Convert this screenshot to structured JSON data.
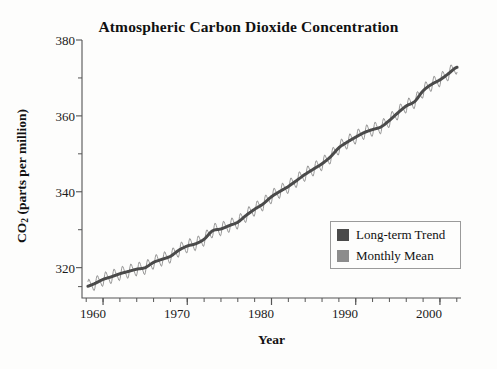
{
  "chart_data": {
    "type": "line",
    "title": "Atmospheric Carbon Dioxide Concentration",
    "xlabel": "Year",
    "ylabel": "CO2 (parts per million)",
    "ylabel_main": "CO",
    "ylabel_sub": "2",
    "ylabel_rest": " (parts per million)",
    "xlim": [
      1957.5,
      2002.5
    ],
    "ylim": [
      312,
      380
    ],
    "grid": false,
    "legend_position": "inside-bottom-right",
    "y_ticks_major": [
      320,
      340,
      360,
      380
    ],
    "y_ticks_minor": [
      330,
      350,
      370
    ],
    "y_tick_labels": [
      "320",
      "340",
      "360",
      "380"
    ],
    "x_ticks_major": [
      1960,
      1970,
      1980,
      1990,
      2000
    ],
    "x_tick_labels": [
      "1960",
      "1970",
      "1980",
      "1990",
      "2000"
    ],
    "x_tick_minor_step": 2,
    "colors": {
      "trend": "#4a4a4a",
      "monthly": "#8c8c8c",
      "axis": "#555555",
      "background": "#fdfdfc",
      "text": "#1a1a1a"
    },
    "series": [
      {
        "name": "Long-term Trend",
        "color": "#4a4a4a",
        "style": "thick-smooth",
        "x": [
          1958.0,
          1959.0,
          1960.0,
          1961.0,
          1962.0,
          1963.0,
          1964.0,
          1965.0,
          1966.0,
          1967.0,
          1968.0,
          1969.0,
          1970.0,
          1971.0,
          1972.0,
          1973.0,
          1974.0,
          1975.0,
          1976.0,
          1977.0,
          1978.0,
          1979.0,
          1980.0,
          1981.0,
          1982.0,
          1983.0,
          1984.0,
          1985.0,
          1986.0,
          1987.0,
          1988.0,
          1989.0,
          1990.0,
          1991.0,
          1992.0,
          1993.0,
          1994.0,
          1995.0,
          1996.0,
          1997.0,
          1998.0,
          1999.0,
          2000.0,
          2001.0,
          2002.0
        ],
        "values": [
          315.0,
          315.8,
          316.9,
          317.6,
          318.4,
          319.0,
          319.6,
          320.0,
          321.4,
          322.2,
          323.0,
          324.6,
          325.7,
          326.3,
          327.5,
          329.7,
          330.2,
          331.1,
          332.0,
          333.8,
          335.4,
          336.8,
          338.7,
          340.1,
          341.4,
          343.0,
          344.6,
          346.0,
          347.4,
          349.2,
          351.6,
          353.1,
          354.4,
          355.6,
          356.4,
          357.1,
          358.8,
          360.8,
          362.6,
          363.8,
          366.6,
          368.3,
          369.5,
          371.1,
          372.8
        ]
      },
      {
        "name": "Monthly Mean",
        "color": "#8c8c8c",
        "style": "thin-seasonal",
        "seasonal_amplitude": 3.1,
        "note": "monthly values oscillate seasonally about the long-term trend, peaking in May and minimum in October"
      }
    ],
    "legend": [
      {
        "label": "Long-term Trend",
        "color": "#4a4a4a"
      },
      {
        "label": "Monthly Mean",
        "color": "#8c8c8c"
      }
    ]
  }
}
